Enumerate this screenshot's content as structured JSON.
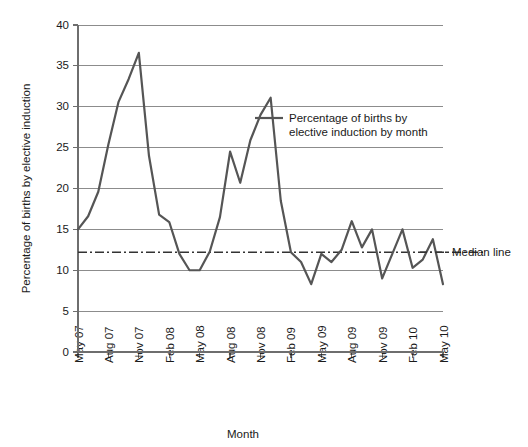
{
  "chart_data": {
    "type": "line",
    "title": "",
    "xlabel": "Month",
    "ylabel": "Percentage of births by elective induction",
    "ylim": [
      0,
      40
    ],
    "ytick_values": [
      0,
      5,
      10,
      15,
      20,
      25,
      30,
      35,
      40
    ],
    "ytick_labels": [
      "0",
      "5",
      "10",
      "15",
      "20",
      "25",
      "30",
      "35",
      "40"
    ],
    "grid": true,
    "grid_axis": "y",
    "legend_position": "inside-upper-right",
    "xtick_labels": [
      "May 07",
      "Aug 07",
      "Nov 07",
      "Feb 08",
      "May 08",
      "Aug 08",
      "Nov 08",
      "Feb 09",
      "May 09",
      "Aug 09",
      "Nov 09",
      "Feb 10",
      "May 10"
    ],
    "x": [
      "May 07",
      "Jun 07",
      "Jul 07",
      "Aug 07",
      "Sep 07",
      "Oct 07",
      "Nov 07",
      "Dec 07",
      "Jan 08",
      "Feb 08",
      "Mar 08",
      "Apr 08",
      "May 08",
      "Jun 08",
      "Jul 08",
      "Aug 08",
      "Sep 08",
      "Oct 08",
      "Nov 08",
      "Dec 08",
      "Jan 09",
      "Feb 09",
      "Mar 09",
      "Apr 09",
      "May 09",
      "Jun 09",
      "Jul 09",
      "Aug 09",
      "Sep 09",
      "Oct 09",
      "Nov 09",
      "Dec 09",
      "Jan 10",
      "Feb 10",
      "Mar 10",
      "Apr 10",
      "May 10"
    ],
    "series": [
      {
        "name": "Percentage of births by elective induction by month",
        "color": "#555555",
        "style": "solid",
        "values": [
          15.0,
          16.6,
          19.6,
          25.4,
          30.6,
          33.4,
          36.6,
          24.0,
          16.8,
          15.9,
          12.0,
          10.0,
          10.0,
          12.3,
          16.5,
          24.5,
          20.7,
          25.9,
          29.0,
          31.1,
          18.5,
          12.2,
          11.0,
          8.3,
          12.0,
          11.0,
          12.5,
          16.0,
          12.8,
          15.0,
          9.0,
          12.0,
          15.0,
          10.3,
          11.3,
          13.8,
          8.3
        ]
      }
    ],
    "reference_lines": [
      {
        "name": "Median line",
        "value": 12.2,
        "color": "#333333",
        "style": "dash-dot",
        "orientation": "horizontal"
      }
    ]
  },
  "legend": {
    "series_label_line1": "Percentage of births by",
    "series_label_line2": "elective induction by month",
    "median_label": "Median line"
  },
  "axes": {
    "x_title": "Month",
    "y_title": "Percentage of births by elective induction"
  }
}
